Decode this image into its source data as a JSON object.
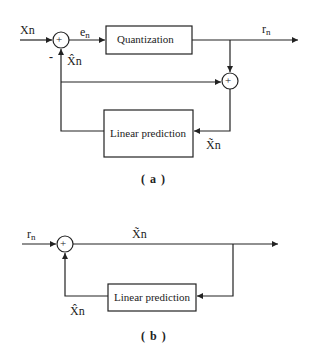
{
  "diagram_a": {
    "caption": "( a )",
    "input_label": "Xn",
    "error_label": "e",
    "error_sub": "n",
    "output_label": "r",
    "output_sub": "n",
    "prediction_label": "X̂n",
    "reconstructed_label": "X̃n",
    "minus_sign": "-",
    "adder1_sign": "+",
    "adder2_sign": "+",
    "quantization_block": "Quantization",
    "predictor_block": "Linear prediction"
  },
  "diagram_b": {
    "caption": "( b )",
    "input_label": "r",
    "input_sub": "n",
    "output_label": "X̃n",
    "prediction_label": "X̂n",
    "adder_sign": "+",
    "predictor_block": "Linear prediction"
  },
  "colors": {
    "line": "#222222",
    "background": "#ffffff"
  }
}
